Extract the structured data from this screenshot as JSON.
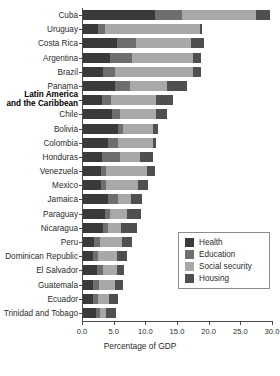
{
  "chart_data": {
    "type": "bar",
    "orientation": "horizontal",
    "stacked": true,
    "title": "",
    "xlabel": "Percentage of GDP",
    "ylabel": "",
    "xlim": [
      0,
      30
    ],
    "xticks": [
      "0.0",
      "5.0",
      "10.0",
      "15.0",
      "20.0",
      "25.0",
      "30.0"
    ],
    "xtick_values": [
      0,
      5,
      10,
      15,
      20,
      25,
      30
    ],
    "grid": false,
    "legend_position": "center-right",
    "series": [
      {
        "name": "Health",
        "color": "#3a3a3a",
        "values": [
          11.4,
          2.4,
          5.4,
          4.2,
          3.2,
          5.1,
          3.0,
          4.6,
          5.6,
          4.0,
          3.0,
          2.9,
          2.8,
          3.9,
          3.4,
          3.2,
          1.7,
          1.5,
          2.2,
          1.6,
          1.6,
          2.0
        ]
      },
      {
        "name": "Education",
        "color": "#6e6e6e",
        "values": [
          4.2,
          1.0,
          3.0,
          3.6,
          1.8,
          2.3,
          1.4,
          1.2,
          0.7,
          1.6,
          2.8,
          0.7,
          0.9,
          1.6,
          0.9,
          0.8,
          1.0,
          0.8,
          0.9,
          0.9,
          0.8,
          0.7
        ]
      },
      {
        "name": "Social security",
        "color": "#a8a8a8",
        "values": [
          11.7,
          15.0,
          8.6,
          9.5,
          12.4,
          5.9,
          7.2,
          5.7,
          4.7,
          5.4,
          3.2,
          6.5,
          5.0,
          2.1,
          2.6,
          2.0,
          3.4,
          3.1,
          2.3,
          2.5,
          1.7,
          0.9
        ]
      },
      {
        "name": "Housing",
        "color": "#4f4f4f",
        "values": [
          2.2,
          0.4,
          2.1,
          1.3,
          1.2,
          3.2,
          2.6,
          1.7,
          0.9,
          0.6,
          2.1,
          1.2,
          1.5,
          1.7,
          2.2,
          2.6,
          1.6,
          1.5,
          1.0,
          1.3,
          1.4,
          1.6
        ]
      }
    ],
    "categories": [
      "Cuba",
      "Uruguay",
      "Costa Rica",
      "Argentina",
      "Brazil",
      "Panama",
      "Latin America and the Caribbean",
      "Chile",
      "Bolivia",
      "Colombia",
      "Honduras",
      "Venezuela",
      "Mexico",
      "Jamaica",
      "Paraguay",
      "Nicaragua",
      "Peru",
      "Dominican Republic",
      "El Salvador",
      "Guatemala",
      "Ecuador",
      "Trinidad and Tobago"
    ],
    "totals": [
      29.5,
      18.8,
      19.1,
      18.6,
      18.6,
      16.5,
      14.2,
      13.2,
      11.9,
      11.6,
      11.1,
      11.3,
      10.2,
      9.3,
      9.1,
      8.6,
      7.7,
      6.9,
      6.4,
      6.3,
      5.5,
      5.2
    ]
  },
  "rows": [
    {
      "label": "Cuba",
      "emphasis": false,
      "segments": [
        11.4,
        4.2,
        11.7,
        2.2
      ]
    },
    {
      "label": "Uruguay",
      "emphasis": false,
      "segments": [
        2.4,
        1.0,
        15.0,
        0.4
      ]
    },
    {
      "label": "Costa Rica",
      "emphasis": false,
      "segments": [
        5.4,
        3.0,
        8.6,
        2.1
      ]
    },
    {
      "label": "Argentina",
      "emphasis": false,
      "segments": [
        4.2,
        3.6,
        9.5,
        1.3
      ]
    },
    {
      "label": "Brazil",
      "emphasis": false,
      "segments": [
        3.2,
        1.8,
        12.4,
        1.2
      ]
    },
    {
      "label": "Panama",
      "emphasis": false,
      "segments": [
        5.1,
        2.3,
        5.9,
        3.2
      ]
    },
    {
      "label": "Latin America and the Caribbean",
      "label_line1": "Latin America",
      "label_line2": "and the Caribbean",
      "emphasis": true,
      "segments": [
        3.0,
        1.4,
        7.2,
        2.6
      ]
    },
    {
      "label": "Chile",
      "emphasis": false,
      "segments": [
        4.6,
        1.2,
        5.7,
        1.7
      ]
    },
    {
      "label": "Bolivia",
      "emphasis": false,
      "segments": [
        5.6,
        0.7,
        4.7,
        0.9
      ]
    },
    {
      "label": "Colombia",
      "emphasis": false,
      "segments": [
        4.0,
        1.6,
        5.4,
        0.6
      ]
    },
    {
      "label": "Honduras",
      "emphasis": false,
      "segments": [
        3.0,
        2.8,
        3.2,
        2.1
      ]
    },
    {
      "label": "Venezuela",
      "emphasis": false,
      "segments": [
        2.9,
        0.7,
        6.5,
        1.2
      ]
    },
    {
      "label": "Mexico",
      "emphasis": false,
      "segments": [
        2.8,
        0.9,
        5.0,
        1.5
      ]
    },
    {
      "label": "Jamaica",
      "emphasis": false,
      "segments": [
        3.9,
        1.6,
        2.1,
        1.7
      ]
    },
    {
      "label": "Paraguay",
      "emphasis": false,
      "segments": [
        3.4,
        0.9,
        2.6,
        2.2
      ]
    },
    {
      "label": "Nicaragua",
      "emphasis": false,
      "segments": [
        3.2,
        0.8,
        2.0,
        2.6
      ]
    },
    {
      "label": "Peru",
      "emphasis": false,
      "segments": [
        1.7,
        1.0,
        3.4,
        1.6
      ]
    },
    {
      "label": "Dominican Republic",
      "emphasis": false,
      "segments": [
        1.5,
        0.8,
        3.1,
        1.5
      ]
    },
    {
      "label": "El Salvador",
      "emphasis": false,
      "segments": [
        2.2,
        0.9,
        2.3,
        1.0
      ]
    },
    {
      "label": "Guatemala",
      "emphasis": false,
      "segments": [
        1.6,
        0.9,
        2.5,
        1.3
      ]
    },
    {
      "label": "Ecuador",
      "emphasis": false,
      "segments": [
        1.6,
        0.8,
        1.7,
        1.4
      ]
    },
    {
      "label": "Trinidad and Tobago",
      "emphasis": false,
      "segments": [
        2.0,
        0.7,
        0.9,
        1.6
      ]
    }
  ],
  "legend": {
    "items": [
      {
        "label": "Health",
        "color": "#3a3a3a"
      },
      {
        "label": "Education",
        "color": "#6e6e6e"
      },
      {
        "label": "Social security",
        "color": "#a8a8a8"
      },
      {
        "label": "Housing",
        "color": "#4f4f4f"
      }
    ]
  },
  "axis": {
    "title": "Percentage of GDP",
    "ticks": [
      "0.0",
      "5.0",
      "10.0",
      "15.0",
      "20.0",
      "25.0",
      "30.0"
    ]
  }
}
